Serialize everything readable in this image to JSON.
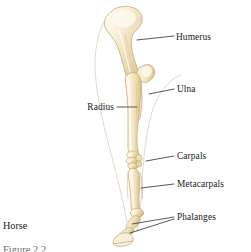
{
  "figure": {
    "subject_caption": "Horse",
    "cut_off_caption": "Figure 2.2",
    "background_color": "#ffffff",
    "bone_fill_light": "#faf3e0",
    "bone_fill_mid": "#f0e2bd",
    "bone_shade": "#d9c089",
    "bone_outline": "#b99f63",
    "leader_line_color": "#3b3b3b",
    "silhouette_color": "#cfc7b6",
    "label_color": "#1b1b1b"
  },
  "labels": [
    {
      "id": "humerus",
      "text": "Humerus",
      "x": 176,
      "y": 33,
      "align": "left"
    },
    {
      "id": "ulna",
      "text": "Ulna",
      "x": 177,
      "y": 86,
      "align": "left"
    },
    {
      "id": "radius",
      "text": "Radius",
      "x": 85,
      "y": 104,
      "align": "left"
    },
    {
      "id": "carpals",
      "text": "Carpals",
      "x": 177,
      "y": 153,
      "align": "left"
    },
    {
      "id": "metacarpals",
      "text": "Metacarpals",
      "x": 177,
      "y": 181,
      "align": "left"
    },
    {
      "id": "phalanges",
      "text": "Phalanges",
      "x": 177,
      "y": 215,
      "align": "left"
    }
  ],
  "leader_lines": [
    {
      "id": "humerus",
      "points": "137,40 174,37"
    },
    {
      "id": "ulna",
      "points": "150,94 174,89"
    },
    {
      "id": "radius",
      "points": "117,108 138,108"
    },
    {
      "id": "carpals",
      "points": "146,160 174,157"
    },
    {
      "id": "metacarpals",
      "points": "141,188 174,185"
    },
    {
      "id": "phalanges_a",
      "points": "131,225 174,218"
    },
    {
      "id": "phalanges_b",
      " points": "136,232 174,220"
    }
  ],
  "anatomy": {
    "bones": [
      "humerus",
      "ulna",
      "radius",
      "carpals",
      "metacarpals",
      "phalanges"
    ]
  }
}
